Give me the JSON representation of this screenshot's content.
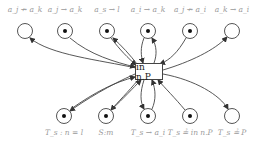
{
  "diagram": {
    "transition": {
      "label": "in n.P",
      "x": 149,
      "y": 71
    },
    "top_places": [
      {
        "label": "a_j ↛ a_k",
        "x": 25,
        "y": 31,
        "token": false,
        "arc": "from-transition"
      },
      {
        "label": "a_j → a_k",
        "x": 65,
        "y": 31,
        "token": true,
        "arc": "to-transition"
      },
      {
        "label": "a_s → l",
        "x": 107,
        "y": 31,
        "token": true,
        "arc": "bidirectional"
      },
      {
        "label": "a_i → a_k",
        "x": 148,
        "y": 31,
        "token": true,
        "arc": "bidirectional"
      },
      {
        "label": "a_j ↛ a_i",
        "x": 190,
        "y": 31,
        "token": true,
        "arc": "to-transition"
      },
      {
        "label": "a_k → a_i",
        "x": 232,
        "y": 31,
        "token": false,
        "arc": "from-transition"
      }
    ],
    "bottom_places": [
      {
        "label": "T_s : n = l",
        "x": 64,
        "y": 116,
        "token": true,
        "arc": "bidirectional"
      },
      {
        "label": "S:m",
        "x": 106,
        "y": 116,
        "token": true,
        "arc": "bidirectional"
      },
      {
        "label": "T_s → a_i",
        "x": 148,
        "y": 116,
        "token": true,
        "arc": "bidirectional"
      },
      {
        "label": "T_s ≟ in n.P",
        "x": 190,
        "y": 116,
        "token": true,
        "arc": "to-transition"
      },
      {
        "label": "T_s ≟ P",
        "x": 232,
        "y": 116,
        "token": false,
        "arc": "from-transition"
      }
    ]
  }
}
